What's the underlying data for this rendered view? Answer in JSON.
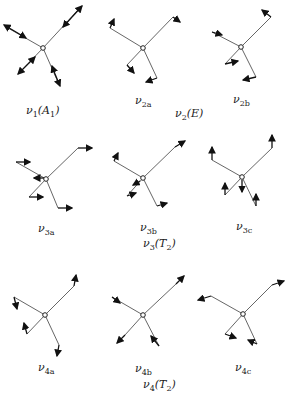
{
  "stroke_color": "#555555",
  "arrow_color": "#111111",
  "modes": [
    {
      "id": "v1",
      "label": "ν",
      "sub": "1",
      "sym": "(A",
      "symsub": "1",
      "symend": ")"
    },
    {
      "id": "v2a",
      "label": "ν",
      "sub": "2a"
    },
    {
      "id": "v2",
      "label": "ν",
      "sub": "2",
      "sym": "(E)"
    },
    {
      "id": "v2b",
      "label": "ν",
      "sub": "2b"
    },
    {
      "id": "v3a",
      "label": "ν",
      "sub": "3a"
    },
    {
      "id": "v3b",
      "label": "ν",
      "sub": "3b"
    },
    {
      "id": "v3c",
      "label": "ν",
      "sub": "3c"
    },
    {
      "id": "v3",
      "label": "ν",
      "sub": "3",
      "sym": "(T",
      "symsub": "2",
      "symend": ")"
    },
    {
      "id": "v4a",
      "label": "ν",
      "sub": "4a"
    },
    {
      "id": "v4b",
      "label": "ν",
      "sub": "4b"
    },
    {
      "id": "v4c",
      "label": "ν",
      "sub": "4c"
    },
    {
      "id": "v4",
      "label": "ν",
      "sub": "4",
      "sym": "(T",
      "symsub": "2",
      "symend": ")"
    }
  ]
}
